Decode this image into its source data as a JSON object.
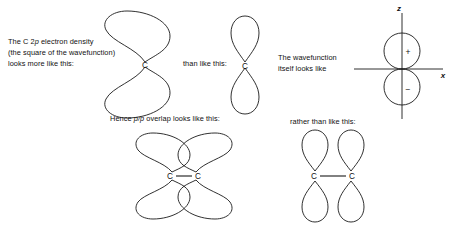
{
  "figure": {
    "background_color": "#ffffff",
    "stroke_color": "#1a1a1a"
  },
  "captions": {
    "density_line1_a": "The C 2",
    "density_line1_p": "p",
    "density_line1_b": " electron density",
    "density_line2": "(the square of the wavefunction)",
    "density_line3": "looks more like this:",
    "than_like_this": "than like this:",
    "wavefunction_line1": "The wavefunction",
    "wavefunction_line2": "itself looks like",
    "hence_a": "Hence ",
    "hence_p1": "p",
    "hence_slash": "/",
    "hence_p2": "p",
    "hence_b": " overlap looks like this:",
    "rather_than": "rather than like this:"
  },
  "labels": {
    "carbon": "C",
    "axis_z": "z",
    "axis_x": "x",
    "sign_positive": "+",
    "sign_negative": "−"
  },
  "diagrams": [
    {
      "name": "electron-density-orbital",
      "description": "Fat rounded two-lobe shape meeting at a point, labelled C",
      "lobe_style": "wide",
      "atom_label": "C"
    },
    {
      "name": "wavefunction-orbital",
      "description": "Narrow teardrop two-lobe p orbital, labelled C",
      "lobe_style": "narrow",
      "atom_label": "C"
    },
    {
      "name": "wavefunction-axes-orbital",
      "description": "Two tangent circles on z axis, plus sign above, minus sign below, x axis horizontal",
      "lobe_style": "circles",
      "signs": [
        "+",
        "−"
      ],
      "axes": [
        "z",
        "x"
      ]
    },
    {
      "name": "pp-overlap-diagram",
      "description": "Two fat two-lobe orbitals overlapping, C-C bond between them",
      "lobe_style": "wide",
      "atom_labels": [
        "C",
        "C"
      ],
      "overlapping": true
    },
    {
      "name": "no-overlap-diagram",
      "description": "Two narrow two-lobe orbitals side by side not overlapping, C-C bond",
      "lobe_style": "narrow",
      "atom_labels": [
        "C",
        "C"
      ],
      "overlapping": false
    }
  ]
}
